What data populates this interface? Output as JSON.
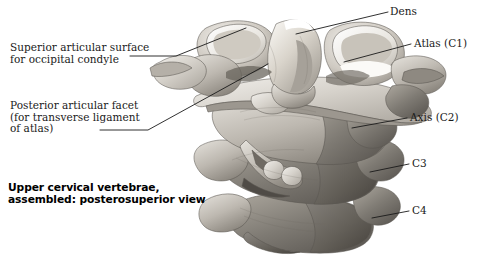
{
  "figure": {
    "title_caption": "Upper cervical vertebrae,\nassembled: posterosuperior view",
    "illustration_name": "upper-cervical-vertebrae-posterosuperior",
    "background_color": "#ffffff",
    "line_color": "#1a1a1a",
    "text_color": "#1a1a1a"
  },
  "labels": {
    "left": [
      {
        "id": "superior-articular-surface",
        "text": "Superior articular surface\nfor occipital condyle",
        "x": 10,
        "y": 42
      },
      {
        "id": "posterior-articular-facet",
        "text": "Posterior articular facet\n(for transverse ligament\nof atlas)",
        "x": 10,
        "y": 100
      }
    ],
    "right": [
      {
        "id": "dens",
        "text": "Dens",
        "x": 390,
        "y": 6
      },
      {
        "id": "atlas-c1",
        "text": "Atlas (C1)",
        "x": 414,
        "y": 38
      },
      {
        "id": "axis-c2",
        "text": "Axis (C2)",
        "x": 410,
        "y": 112
      },
      {
        "id": "c3",
        "text": "C3",
        "x": 412,
        "y": 158
      },
      {
        "id": "c4",
        "text": "C4",
        "x": 412,
        "y": 205
      }
    ]
  },
  "caption": {
    "line1": "Upper cervical vertebrae,",
    "line2": "assembled: posterosuperior view",
    "x": 8,
    "y": 182
  },
  "anatomy_parts": [
    "dens (odontoid process of axis)",
    "atlas (C1) lateral mass",
    "atlas posterior arch",
    "axis (C2) body and spinous process",
    "C3 vertebra",
    "C4 vertebra",
    "transverse processes"
  ]
}
